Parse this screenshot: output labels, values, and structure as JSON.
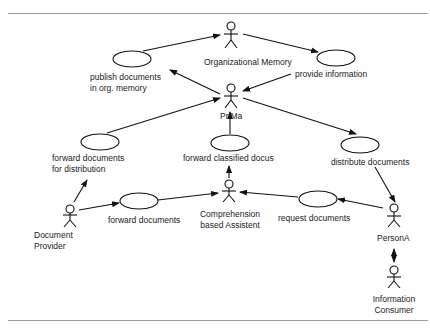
{
  "diagram": {
    "type": "use-case",
    "actors": [
      {
        "id": "org_memory",
        "label": "Organizational Memory"
      },
      {
        "id": "prima",
        "label": "PriMa"
      },
      {
        "id": "comprehension",
        "label_line1": "Comprehension",
        "label_line2": "based Assistent"
      },
      {
        "id": "doc_provider",
        "label_line1": "Document",
        "label_line2": "Provider"
      },
      {
        "id": "persona",
        "label": "PersonA"
      },
      {
        "id": "info_consumer",
        "label_line1": "Information",
        "label_line2": "Consumer"
      }
    ],
    "use_cases": [
      {
        "id": "publish",
        "label_line1": "publish documents",
        "label_line2": "in org. memory"
      },
      {
        "id": "provide",
        "label": "provide information"
      },
      {
        "id": "fwd_dist",
        "label_line1": "forward documents",
        "label_line2": "for distribution"
      },
      {
        "id": "fwd_classified",
        "label": "forward classified docus"
      },
      {
        "id": "distribute",
        "label": "distribute documents"
      },
      {
        "id": "fwd_docs",
        "label": "forward documents"
      },
      {
        "id": "request",
        "label": "request documents"
      }
    ],
    "edges": [
      {
        "from": "publish",
        "to": "org_memory"
      },
      {
        "from": "org_memory",
        "to": "provide"
      },
      {
        "from": "prima",
        "to": "publish"
      },
      {
        "from": "provide",
        "to": "prima"
      },
      {
        "from": "fwd_dist",
        "to": "prima"
      },
      {
        "from": "fwd_classified",
        "to": "prima"
      },
      {
        "from": "prima",
        "to": "distribute"
      },
      {
        "from": "comprehension",
        "to": "fwd_classified"
      },
      {
        "from": "distribute",
        "to": "persona"
      },
      {
        "from": "doc_provider",
        "to": "fwd_dist"
      },
      {
        "from": "doc_provider",
        "to": "fwd_docs"
      },
      {
        "from": "fwd_docs",
        "to": "comprehension"
      },
      {
        "from": "request",
        "to": "comprehension"
      },
      {
        "from": "persona",
        "to": "request"
      },
      {
        "from": "persona",
        "to": "info_consumer",
        "bidirectional": true
      }
    ]
  }
}
